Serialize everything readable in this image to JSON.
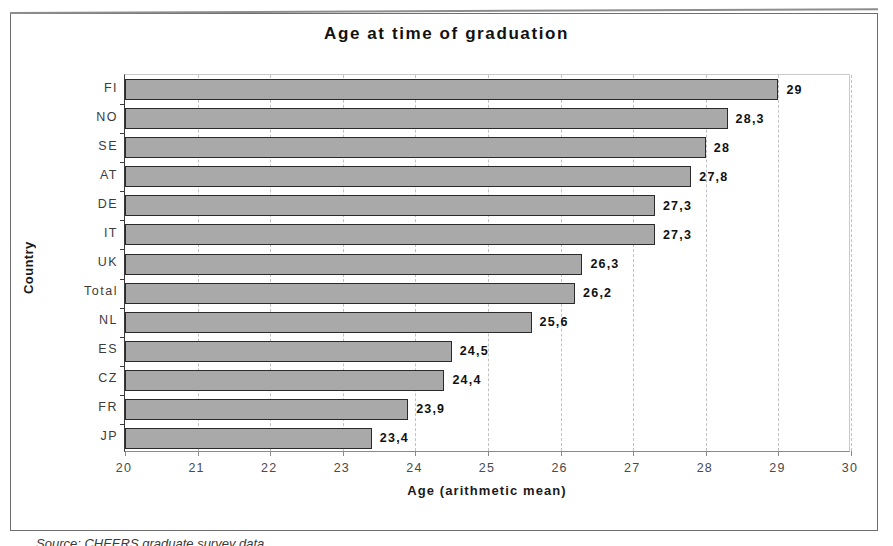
{
  "figure": {
    "source_caption": "Source: CHEERS graduate survey data"
  },
  "chart_data": {
    "type": "bar",
    "orientation": "horizontal",
    "title": "Age at time of graduation",
    "xlabel": "Age (arithmetic mean)",
    "ylabel": "Country",
    "xlim": [
      20,
      30
    ],
    "ylim": null,
    "grid": "vertical-dashed",
    "legend": "none",
    "decimal_separator": ",",
    "xticks": [
      "20",
      "21",
      "22",
      "23",
      "24",
      "25",
      "26",
      "27",
      "28",
      "29",
      "30"
    ],
    "categories": [
      "FI",
      "NO",
      "SE",
      "AT",
      "DE",
      "IT",
      "UK",
      "Total",
      "NL",
      "ES",
      "CZ",
      "FR",
      "JP"
    ],
    "values": [
      29,
      28.3,
      28,
      27.8,
      27.3,
      27.3,
      26.3,
      26.2,
      25.6,
      24.5,
      24.4,
      23.9,
      23.4
    ],
    "value_labels": [
      "29",
      "28,3",
      "28",
      "27,8",
      "27,3",
      "27,3",
      "26,3",
      "26,2",
      "25,6",
      "24,5",
      "24,4",
      "23,9",
      "23,4"
    ],
    "colors": {
      "bar_fill": "#a9a9a9",
      "bar_border": "#2a2a2a",
      "gridline": "#c2c2c2",
      "axis": "#3a3a3a",
      "text": "#111111"
    }
  }
}
